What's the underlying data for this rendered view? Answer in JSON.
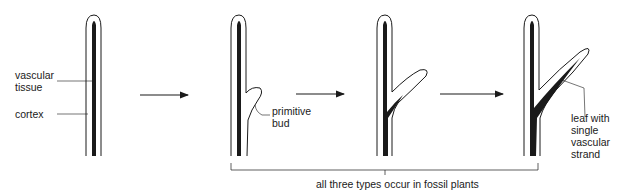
{
  "labels": {
    "vascular_tissue": "vascular\ntissue",
    "cortex": "cortex",
    "primitive_bud": "primitive\nbud",
    "leaf_single_strand": "leaf with\nsingle\nvascular\nstrand",
    "bracket_caption": "all three types occur in fossil plants"
  },
  "stages": [
    {
      "name": "stem-with-vascular-tissue"
    },
    {
      "name": "stem-with-primitive-bud"
    },
    {
      "name": "stem-with-developing-leaf"
    },
    {
      "name": "stem-with-leaf-single-vascular-strand"
    }
  ],
  "colors": {
    "ink": "#1a1a1a",
    "background": "#ffffff"
  }
}
